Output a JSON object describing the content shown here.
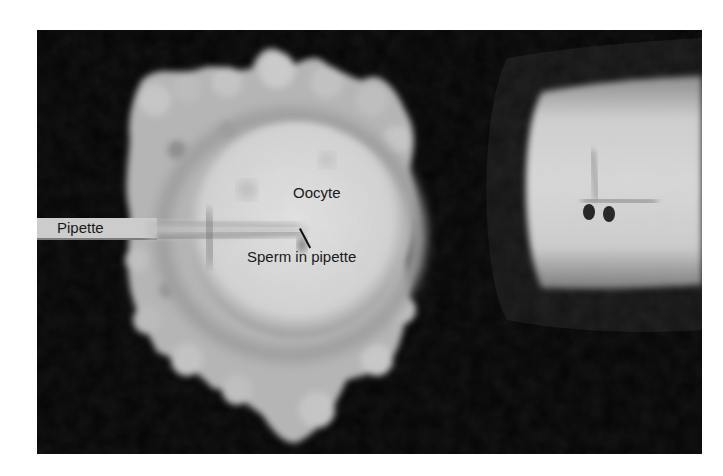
{
  "figure": {
    "labels": {
      "pipette": "Pipette",
      "oocyte": "Oocyte",
      "sperm": "Sperm in pipette"
    },
    "colors": {
      "background": "#050505",
      "cells": "#bdbdbd",
      "oocyte": "#d8d8d8",
      "holding_pipette": "#c9c9c9",
      "text": "#1a1a1a"
    }
  }
}
